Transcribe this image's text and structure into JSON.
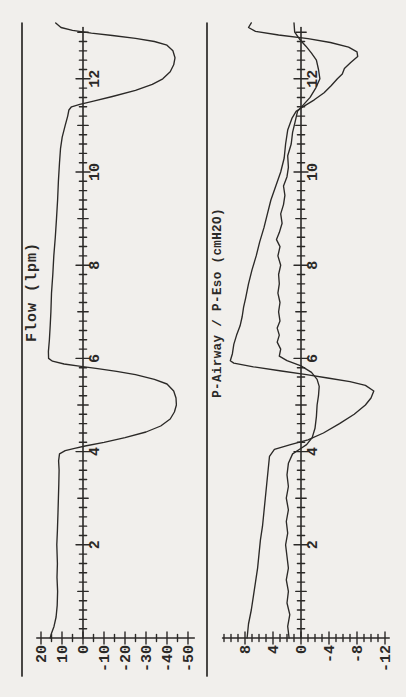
{
  "page": {
    "kind": "scanned strip-chart recording, rotated 90° CCW (time axis vertical, increasing upward)",
    "paper_color": "#f1efec",
    "ink_color": "#2b2927"
  },
  "chart_data": [
    {
      "type": "line",
      "id": "flow",
      "title": "Flow (lpm)",
      "orientation": "rotated-90ccw",
      "time_axis": {
        "label": "",
        "min": 0,
        "max": 13.05,
        "minor_step": 0.2,
        "unit_step": 1,
        "major_step": 2,
        "tick_labels": [
          "2",
          "4",
          "6",
          "8",
          "10",
          "12"
        ],
        "direction": "upward"
      },
      "value_axis": {
        "label": "Flow (lpm)",
        "min": -53,
        "max": 22,
        "minor_step": 5,
        "major_step": 10,
        "tick_labels": [
          "20",
          "10",
          "0",
          "-10",
          "-20",
          "-30",
          "-40",
          "-50"
        ],
        "direction": "leftward-positive"
      },
      "grid": false,
      "legend": false,
      "series": [
        {
          "name": "Flow",
          "points": [
            [
              0,
              15.6
            ],
            [
              0.1,
              15.0
            ],
            [
              0.25,
              13.8
            ],
            [
              0.45,
              12.8
            ],
            [
              0.7,
              12.3
            ],
            [
              1.0,
              12.1
            ],
            [
              1.3,
              12.4
            ],
            [
              1.6,
              12.2
            ],
            [
              2.0,
              12.5
            ],
            [
              2.3,
              12.2
            ],
            [
              2.7,
              11.9
            ],
            [
              3.0,
              11.7
            ],
            [
              3.3,
              11.5
            ],
            [
              3.6,
              11.4
            ],
            [
              3.8,
              11.6
            ],
            [
              3.95,
              11.2
            ],
            [
              4.02,
              8.5
            ],
            [
              4.07,
              4.0
            ],
            [
              4.12,
              -1.0
            ],
            [
              4.2,
              -10
            ],
            [
              4.3,
              -20
            ],
            [
              4.42,
              -30
            ],
            [
              4.55,
              -37
            ],
            [
              4.7,
              -41.5
            ],
            [
              4.85,
              -43.5
            ],
            [
              5.0,
              -44.5
            ],
            [
              5.15,
              -44.3
            ],
            [
              5.3,
              -43.2
            ],
            [
              5.45,
              -40
            ],
            [
              5.55,
              -34
            ],
            [
              5.65,
              -25
            ],
            [
              5.72,
              -16
            ],
            [
              5.78,
              -7
            ],
            [
              5.83,
              1
            ],
            [
              5.88,
              9
            ],
            [
              5.94,
              14.5
            ],
            [
              6.0,
              16.4
            ],
            [
              6.15,
              16.5
            ],
            [
              6.4,
              16.0
            ],
            [
              6.7,
              15.6
            ],
            [
              7.0,
              15.3
            ],
            [
              7.4,
              15.0
            ],
            [
              7.8,
              14.4
            ],
            [
              8.2,
              13.9
            ],
            [
              8.6,
              13.2
            ],
            [
              9.0,
              12.6
            ],
            [
              9.4,
              12.1
            ],
            [
              9.8,
              11.7
            ],
            [
              10.2,
              11.2
            ],
            [
              10.5,
              10.7
            ],
            [
              10.75,
              9.9
            ],
            [
              11.0,
              8.5
            ],
            [
              11.2,
              7.3
            ],
            [
              11.33,
              6.7
            ],
            [
              11.4,
              5.5
            ],
            [
              11.45,
              1.5
            ],
            [
              11.52,
              -5
            ],
            [
              11.62,
              -14
            ],
            [
              11.75,
              -25
            ],
            [
              11.88,
              -33
            ],
            [
              12.0,
              -38
            ],
            [
              12.15,
              -41.5
            ],
            [
              12.3,
              -43.2
            ],
            [
              12.45,
              -43.8
            ],
            [
              12.6,
              -42.8
            ],
            [
              12.72,
              -40
            ],
            [
              12.8,
              -34
            ],
            [
              12.87,
              -25
            ],
            [
              12.93,
              -14
            ],
            [
              12.98,
              -4
            ],
            [
              13.04,
              5
            ],
            [
              13.1,
              10.5
            ],
            [
              13.2,
              13
            ]
          ]
        }
      ]
    },
    {
      "type": "line",
      "id": "pressure",
      "title": "P-Airway / P-Eso (cmH2O)",
      "orientation": "rotated-90ccw",
      "time_axis": {
        "label": "",
        "min": 0,
        "max": 13.05,
        "minor_step": 0.2,
        "unit_step": 1,
        "major_step": 2,
        "tick_labels": [
          "2",
          "4",
          "6",
          "8",
          "10",
          "12"
        ],
        "direction": "upward"
      },
      "value_axis": {
        "label": "P-Airway / P-Eso (cmH2O)",
        "min": -12.6,
        "max": 11.2,
        "minor_step": 1,
        "major_step": 4,
        "tick_labels": [
          "8",
          "4",
          "0",
          "-4",
          "-8",
          "-12"
        ],
        "direction": "leftward-positive"
      },
      "grid": false,
      "legend": false,
      "series": [
        {
          "name": "P-Eso",
          "points": [
            [
              0,
              7.7
            ],
            [
              0.3,
              7.5
            ],
            [
              0.6,
              7.1
            ],
            [
              0.9,
              6.8
            ],
            [
              1.2,
              6.5
            ],
            [
              1.5,
              6.2
            ],
            [
              1.8,
              6.0
            ],
            [
              2.1,
              5.8
            ],
            [
              2.4,
              5.5
            ],
            [
              2.7,
              5.3
            ],
            [
              3.0,
              5.1
            ],
            [
              3.3,
              4.9
            ],
            [
              3.6,
              4.7
            ],
            [
              3.9,
              4.5
            ],
            [
              4.05,
              3.8
            ],
            [
              4.15,
              1.5
            ],
            [
              4.25,
              -1.0
            ],
            [
              4.4,
              -3.2
            ],
            [
              4.6,
              -5.5
            ],
            [
              4.8,
              -7.6
            ],
            [
              5.0,
              -9.2
            ],
            [
              5.15,
              -10.0
            ],
            [
              5.3,
              -10.4
            ],
            [
              5.42,
              -9.2
            ],
            [
              5.5,
              -7.0
            ],
            [
              5.58,
              -3.8
            ],
            [
              5.65,
              -0.8
            ],
            [
              5.73,
              2.8
            ],
            [
              5.82,
              6.8
            ],
            [
              5.9,
              9.6
            ],
            [
              5.95,
              10.1
            ],
            [
              6.1,
              9.8
            ],
            [
              6.3,
              9.6
            ],
            [
              6.5,
              9.2
            ],
            [
              6.7,
              8.7
            ],
            [
              6.9,
              8.4
            ],
            [
              7.1,
              8.2
            ],
            [
              7.3,
              7.9
            ],
            [
              7.6,
              7.5
            ],
            [
              7.9,
              7.0
            ],
            [
              8.2,
              6.4
            ],
            [
              8.5,
              5.9
            ],
            [
              8.8,
              5.3
            ],
            [
              9.1,
              4.8
            ],
            [
              9.4,
              4.3
            ],
            [
              9.7,
              3.6
            ],
            [
              10.0,
              2.9
            ],
            [
              10.3,
              2.4
            ],
            [
              10.6,
              2.2
            ],
            [
              10.9,
              1.9
            ],
            [
              11.15,
              1.3
            ],
            [
              11.3,
              0.7
            ],
            [
              11.42,
              -0.5
            ],
            [
              11.55,
              -1.9
            ],
            [
              11.7,
              -3.3
            ],
            [
              11.85,
              -4.3
            ],
            [
              12.0,
              -5.2
            ],
            [
              12.1,
              -5.9
            ],
            [
              12.22,
              -6.2
            ],
            [
              12.35,
              -7.1
            ],
            [
              12.48,
              -8.1
            ],
            [
              12.58,
              -8.0
            ],
            [
              12.68,
              -6.8
            ],
            [
              12.78,
              -4.2
            ],
            [
              12.86,
              -1.0
            ],
            [
              12.94,
              3.2
            ],
            [
              13.02,
              6.5
            ],
            [
              13.1,
              7.5
            ],
            [
              13.2,
              7.1
            ]
          ]
        },
        {
          "name": "P-Airway",
          "points": [
            [
              0,
              1.7
            ],
            [
              0.25,
              1.9
            ],
            [
              0.5,
              1.6
            ],
            [
              0.75,
              2.0
            ],
            [
              1.0,
              1.8
            ],
            [
              1.25,
              2.1
            ],
            [
              1.5,
              1.8
            ],
            [
              1.75,
              2.0
            ],
            [
              2.0,
              2.2
            ],
            [
              2.25,
              1.9
            ],
            [
              2.5,
              2.1
            ],
            [
              2.75,
              1.8
            ],
            [
              3.0,
              2.1
            ],
            [
              3.25,
              1.8
            ],
            [
              3.5,
              2.0
            ],
            [
              3.75,
              1.8
            ],
            [
              3.95,
              1.2
            ],
            [
              4.05,
              0.2
            ],
            [
              4.15,
              -0.8
            ],
            [
              4.3,
              -1.6
            ],
            [
              4.5,
              -2.0
            ],
            [
              4.75,
              -2.2
            ],
            [
              5.0,
              -2.3
            ],
            [
              5.2,
              -2.5
            ],
            [
              5.4,
              -2.6
            ],
            [
              5.55,
              -2.3
            ],
            [
              5.7,
              -1.5
            ],
            [
              5.84,
              0.0
            ],
            [
              5.95,
              2.0
            ],
            [
              6.05,
              3.1
            ],
            [
              6.2,
              2.9
            ],
            [
              6.35,
              3.4
            ],
            [
              6.5,
              3.1
            ],
            [
              6.65,
              3.4
            ],
            [
              6.8,
              3.0
            ],
            [
              7.0,
              3.2
            ],
            [
              7.2,
              3.0
            ],
            [
              7.4,
              3.3
            ],
            [
              7.6,
              3.1
            ],
            [
              7.8,
              3.2
            ],
            [
              8.0,
              2.9
            ],
            [
              8.2,
              3.3
            ],
            [
              8.4,
              3.0
            ],
            [
              8.55,
              3.5
            ],
            [
              8.7,
              3.1
            ],
            [
              8.9,
              2.7
            ],
            [
              9.1,
              2.9
            ],
            [
              9.3,
              2.5
            ],
            [
              9.5,
              2.3
            ],
            [
              9.7,
              2.5
            ],
            [
              9.9,
              2.0
            ],
            [
              10.1,
              1.8
            ],
            [
              10.35,
              1.9
            ],
            [
              10.6,
              1.4
            ],
            [
              10.85,
              1.2
            ],
            [
              11.1,
              0.8
            ],
            [
              11.3,
              0.5
            ],
            [
              11.45,
              -0.4
            ],
            [
              11.6,
              -1.3
            ],
            [
              11.8,
              -2.1
            ],
            [
              12.0,
              -2.7
            ],
            [
              12.2,
              -2.5
            ],
            [
              12.4,
              -2.2
            ],
            [
              12.55,
              -1.5
            ],
            [
              12.7,
              -0.7
            ],
            [
              12.85,
              0.2
            ],
            [
              13.0,
              0.9
            ],
            [
              13.2,
              1.0
            ]
          ]
        }
      ]
    }
  ]
}
